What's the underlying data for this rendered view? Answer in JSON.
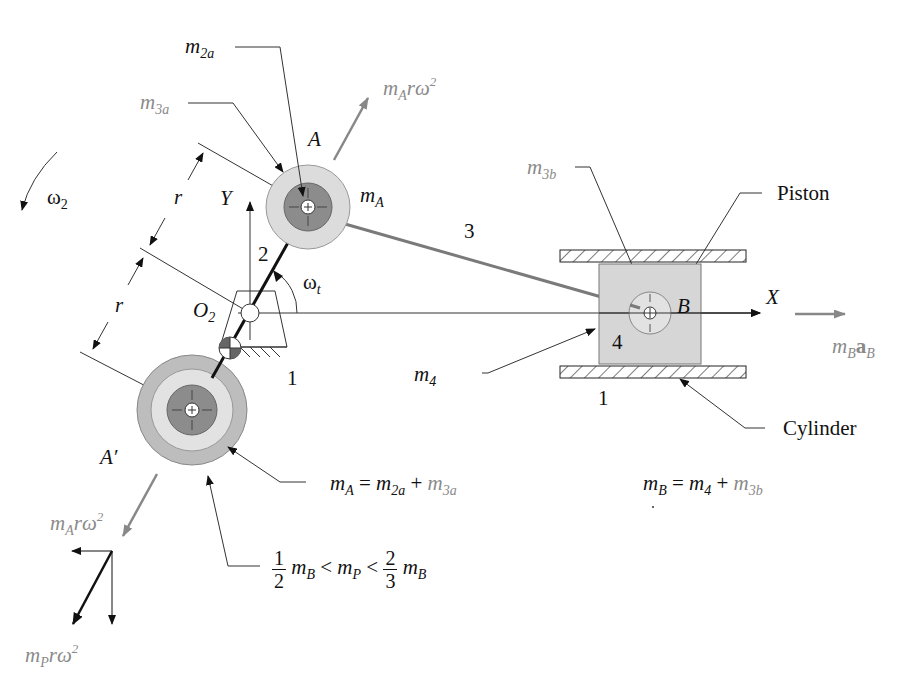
{
  "figure": {
    "type": "slider-crank balancing diagram",
    "colors": {
      "black_label": "#111111",
      "gray_label": "#8a8a8a",
      "crank_pin_mass_dark": "#8c8c8c",
      "crank_pin_mass_light": "#d9d9d9",
      "counterweight_outer": "#bdbdbd",
      "piston_fill": "#d6d6d6",
      "conrod": "#7a7a7a"
    },
    "labels": {
      "m2a": {
        "base": "m",
        "sub": "2a"
      },
      "m3a": {
        "base": "m",
        "sub": "3a"
      },
      "mA_force_top": {
        "base": "m",
        "sub": "A",
        "rest": "rω",
        "sup": "2"
      },
      "point_A": "A",
      "mA": {
        "base": "m",
        "sub": "A"
      },
      "omega2": {
        "base": "ω",
        "sub": "2"
      },
      "r_upper": "r",
      "r_lower": "r",
      "axis_Y": "Y",
      "link2": "2",
      "omega_t": {
        "base": "ω",
        "sub": "t"
      },
      "O2": {
        "base": "O",
        "sub": "2"
      },
      "link3": "3",
      "m3b": {
        "base": "m",
        "sub": "3b"
      },
      "piston": "Piston",
      "point_B": "B",
      "axis_X": "X",
      "mB_aB": {
        "m": "m",
        "sub1": "B",
        "a": "a",
        "sub2": "B"
      },
      "m4": {
        "base": "m",
        "sub": "4"
      },
      "link4": "4",
      "ground1_left": "1",
      "ground1_right": "1",
      "cylinder": "Cylinder",
      "point_A_prime": "A′",
      "mA_force_bottom": {
        "base": "m",
        "sub": "A",
        "rest": "rω",
        "sup": "2"
      },
      "mP_force": {
        "base": "m",
        "sub": "P",
        "rest": "rω",
        "sup": "2"
      }
    },
    "equations": {
      "mA_eq": {
        "lhs": "m",
        "lhs_sub": "A",
        "eq": "=",
        "t1": "m",
        "t1_sub": "2a",
        "plus": "+",
        "t2": "m",
        "t2_sub": "3a"
      },
      "mB_eq": {
        "lhs": "m",
        "lhs_sub": "B",
        "eq": "=",
        "t1": "m",
        "t1_sub": "4",
        "plus": "+",
        "t2": "m",
        "t2_sub": "3b"
      },
      "mP_range": {
        "f1_num": "1",
        "f1_den": "2",
        "m1": "m",
        "m1_sub": "B",
        "lt1": "<",
        "mid": "m",
        "mid_sub": "P",
        "lt2": "<",
        "f2_num": "2",
        "f2_den": "3",
        "m2": "m",
        "m2_sub": "B"
      }
    }
  }
}
